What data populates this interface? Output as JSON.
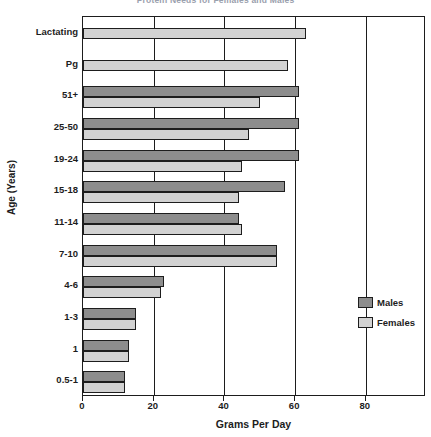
{
  "chart_data": {
    "type": "bar",
    "orientation": "horizontal",
    "title": "Protein Needs for Females and Males",
    "xlabel": "Grams Per Day",
    "ylabel": "Age (Years)",
    "xlim": [
      0,
      97
    ],
    "xticks": [
      0,
      20,
      40,
      60,
      80
    ],
    "xtick_labels": [
      "0",
      "20",
      "40",
      "60",
      "80"
    ],
    "grid": true,
    "legend_position": "right",
    "categories": [
      "0.5-1",
      "1",
      "1-3",
      "4-6",
      "7-10",
      "11-14",
      "15-18",
      "19-24",
      "25-50",
      "51+",
      "Pg",
      "Lactating"
    ],
    "series": [
      {
        "name": "Males",
        "color": "#8d8d8d",
        "values": [
          12,
          13,
          15,
          23,
          55,
          44,
          57,
          61,
          61,
          61,
          null,
          null
        ]
      },
      {
        "name": "Females",
        "color": "#d2d2d2",
        "values": [
          12,
          13,
          15,
          22,
          55,
          45,
          44,
          45,
          47,
          50,
          58,
          63
        ]
      }
    ]
  },
  "legend": {
    "entries": [
      {
        "label": "Males",
        "swatch": "males"
      },
      {
        "label": "Females",
        "swatch": "females"
      }
    ]
  },
  "colors": {
    "males": "#8d8d8d",
    "females": "#d2d2d2",
    "axis": "#1d1d1d",
    "background": "#ffffff"
  }
}
